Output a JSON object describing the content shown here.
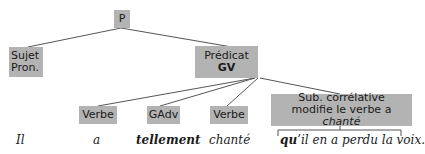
{
  "tree": {
    "root": {
      "label": "P"
    },
    "subject": {
      "line1": "Sujet",
      "line2": "Pron."
    },
    "predicate": {
      "line1": "Prédicat",
      "line2": "GV"
    },
    "children": {
      "verbe1": {
        "label": "Verbe"
      },
      "gadv": {
        "label": "GAdv"
      },
      "verbe2": {
        "label": "Verbe"
      },
      "sub": {
        "line1": "Sub. corrélative",
        "line2_prefix": "modifie le verbe a ",
        "line2_italic": "chanté"
      }
    }
  },
  "sentence": {
    "w1": "Il",
    "w2": "a",
    "w3": "tellement",
    "w4": "chanté",
    "w5_bold": "qu",
    "w5_rest": "’il en a perdu la voix."
  },
  "colors": {
    "node_fill": "#b3b3b3",
    "line": "#555555",
    "text": "#1a1a1a"
  }
}
